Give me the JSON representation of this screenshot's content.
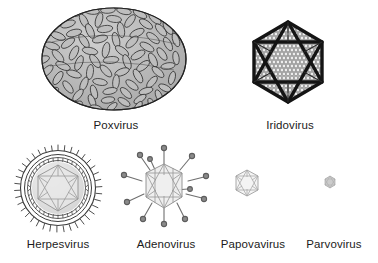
{
  "figure": {
    "background_color": "#ffffff",
    "width": 378,
    "height": 263,
    "style": "grayscale line drawing",
    "text_color": "#1b1b1b"
  },
  "rows": [
    {
      "name": "top-row",
      "items": [
        {
          "label": "Poxvirus",
          "shape": "brick-shaped ovoid",
          "surface": "dense elongated oval surface tubules",
          "enveloped": true,
          "relative_size": "largest",
          "center": [
            114,
            59
          ],
          "radius_x": 72,
          "radius_y": 51,
          "fill_color": "#b8b8b8",
          "stroke_color": "#2b2b2b"
        },
        {
          "label": "Iridovirus",
          "shape": "icosahedron",
          "surface": "dense capsomere circles with dark edges",
          "enveloped": false,
          "relative_size": "large",
          "center": [
            288,
            62
          ],
          "radius": 40,
          "fill_color": "#d9d9d9",
          "stroke_color": "#1e1e1e"
        }
      ]
    },
    {
      "name": "bottom-row",
      "items": [
        {
          "label": "Herpesvirus",
          "shape": "enveloped icosahedral nucleocapsid",
          "surface": "radiating envelope spikes over double membrane ring",
          "enveloped": true,
          "relative_size": "medium",
          "center": [
            58,
            186
          ],
          "radius": 38,
          "fill_color": "#e8e8e8",
          "stroke_color": "#4a4a4a"
        },
        {
          "label": "Adenovirus",
          "shape": "icosahedron with vertex fibers",
          "surface": "twelve penton fibers ending in terminal knobs",
          "enveloped": false,
          "relative_size": "medium",
          "center": [
            164,
            186
          ],
          "radius": 24,
          "fill_color": "#f0f0f0",
          "stroke_color": "#7a7a7a"
        },
        {
          "label": "Papovavirus",
          "shape": "icosahedron",
          "surface": "plain faceted capsid",
          "enveloped": false,
          "relative_size": "small",
          "center": [
            247,
            183
          ],
          "radius": 14,
          "fill_color": "#f4f4f4",
          "stroke_color": "#8a8a8a"
        },
        {
          "label": "Parvovirus",
          "shape": "icosahedron",
          "surface": "plain faceted capsid",
          "enveloped": false,
          "relative_size": "smallest",
          "center": [
            330,
            182
          ],
          "radius": 6,
          "fill_color": "#c9c9c9",
          "stroke_color": "#909090"
        }
      ]
    }
  ]
}
